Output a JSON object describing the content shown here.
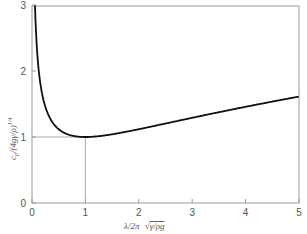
{
  "chart_data": {
    "type": "line",
    "title": "",
    "xlabel": "λ/2π √(γ/ρg)",
    "ylabel": "c_p / (4gγ/ρ)^(1/4)",
    "xlim": [
      0,
      5
    ],
    "ylim": [
      0,
      3
    ],
    "xticks": [
      "0",
      "1",
      "2",
      "3",
      "4",
      "5"
    ],
    "yticks": [
      "0",
      "1",
      "2",
      "3"
    ],
    "grid": false,
    "legend": null,
    "reference_lines": [
      {
        "type": "horizontal",
        "y": 1,
        "x_from": 0,
        "x_to": 1
      },
      {
        "type": "vertical",
        "x": 1,
        "y_from": 0,
        "y_to": 1
      }
    ],
    "series": [
      {
        "name": "phase speed",
        "x": [
          0.06,
          0.08,
          0.1,
          0.13,
          0.17,
          0.2,
          0.25,
          0.3,
          0.4,
          0.5,
          0.6,
          0.7,
          0.8,
          0.9,
          1.0,
          1.25,
          1.5,
          2.0,
          2.5,
          3.0,
          3.5,
          4.0,
          4.5,
          5.0
        ],
        "values": [
          2.89,
          2.51,
          2.25,
          1.98,
          1.76,
          1.61,
          1.46,
          1.36,
          1.22,
          1.12,
          1.07,
          1.03,
          1.01,
          1.0,
          1.0,
          1.01,
          1.04,
          1.12,
          1.22,
          1.29,
          1.37,
          1.46,
          1.53,
          1.61
        ]
      }
    ]
  },
  "axes": {
    "x_label_main": "λ/2π",
    "x_label_root": "γ/ρg",
    "y_label": "c",
    "y_label_sub": "p",
    "y_label_rest": "/(4gγ/ρ)",
    "y_label_exp": "1/4"
  }
}
